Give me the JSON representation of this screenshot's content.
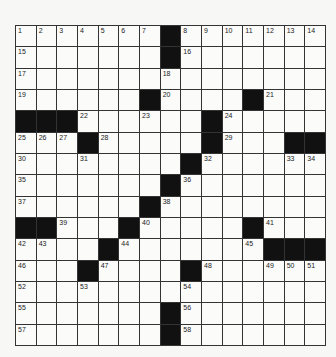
{
  "puzzle": {
    "rows": 15,
    "cols": 15,
    "grid": [
      "1,2,3,4,5,6,7,#,8,9,10,11,12,13,14",
      "15,.,.,.,.,.,.,#,16,.,.,.,.,.,.",
      "17,.,.,.,.,.,.,18,.,.,.,.,.,.,.",
      "19,.,.,.,.,.,#,20,.,.,.,#,21,.,.",
      "#,#,#,22,.,.,23,.,.,#,24,.,.,.,.",
      "25,26,27,#,28,.,.,.,.,#,29,.,.,#,#",
      "30,.,.,31,.,.,.,.,#,32,.,.,.,33,34",
      "35,.,.,.,.,.,.,#,36,.,.,.,.,.,.",
      "37,.,.,.,.,.,#,38,.,.,.,.,.,.,.",
      "#,#,39,.,.,#,40,.,.,.,.,#,41,.,.",
      "42,43,.,.,#,44,.,.,.,.,.,45,#,#,#",
      "46,.,.,#,47,.,.,.,#,48,.,.,49,50,51",
      "52,.,.,53,.,.,.,.,54,.,.,.,.,.,.",
      "55,.,.,.,.,.,.,#,56,.,.,.,.,.,.",
      "57,.,.,.,.,.,.,#,58,.,.,.,.,.,."
    ]
  }
}
